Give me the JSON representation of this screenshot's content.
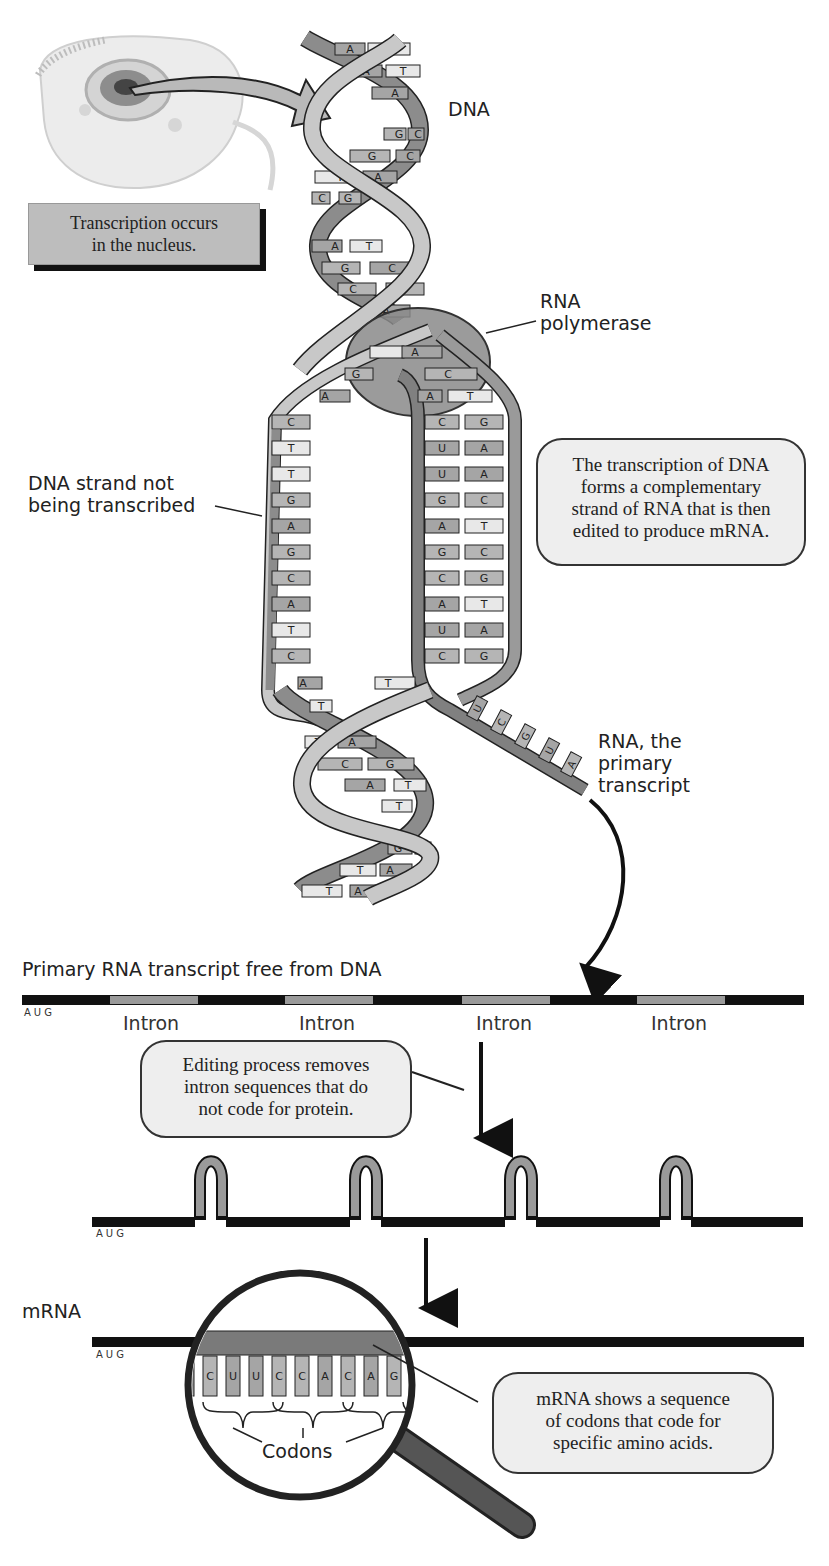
{
  "figure": {
    "labels": {
      "dna": "DNA",
      "rna_polymerase_line1": "RNA",
      "rna_polymerase_line2": "polymerase",
      "nontranscribed_line1": "DNA strand not",
      "nontranscribed_line2": "being transcribed",
      "primary_transcript_line1": "RNA, the",
      "primary_transcript_line2": "primary",
      "primary_transcript_line3": "transcript",
      "primary_free": "Primary RNA transcript free from DNA",
      "mrna": "mRNA",
      "codons": "Codons",
      "aug": "AUG"
    },
    "nucleus_box": {
      "line1": "Transcription occurs",
      "line2": "in the nucleus."
    },
    "callouts": {
      "transcription": [
        "The transcription of DNA",
        "forms a complementary",
        "strand of RNA that is then",
        "edited to produce mRNA."
      ],
      "editing": [
        "Editing process removes",
        "intron sequences that do",
        "not code for protein."
      ],
      "codons": [
        "mRNA shows a sequence",
        "of codons that code for",
        "specific amino acids."
      ]
    },
    "introns": [
      "Intron",
      "Intron",
      "Intron",
      "Intron"
    ],
    "helix_top_pairs": [
      [
        "A",
        "T"
      ],
      [
        "A",
        "T"
      ],
      [
        "A",
        ""
      ],
      [
        "G",
        "C"
      ],
      [
        "G",
        "C"
      ],
      [
        "T",
        "A"
      ],
      [
        "C",
        "G"
      ],
      [
        "A",
        "T"
      ],
      [
        "G",
        "C"
      ],
      [
        "C",
        "G"
      ],
      [
        "A",
        ""
      ]
    ],
    "bubble_pairs_top": [
      [
        "",
        "A"
      ],
      [
        "G",
        "C"
      ],
      [
        "A",
        "A"
      ],
      [
        "C",
        "T"
      ]
    ],
    "left_strand_bases": [
      "C",
      "T",
      "T",
      "G",
      "A",
      "G",
      "C",
      "A",
      "T",
      "C",
      "A"
    ],
    "template_strand_bases": [
      "G",
      "A",
      "A",
      "C",
      "T",
      "C",
      "G",
      "T",
      "A",
      "G"
    ],
    "rna_bases_in_bubble": [
      "C",
      "U",
      "U",
      "G",
      "A",
      "G",
      "C",
      "A",
      "U",
      "C"
    ],
    "rna_tail_bases": [
      "U",
      "C",
      "G",
      "U",
      "A"
    ],
    "helix_bottom_pairs": [
      [
        "T",
        ""
      ],
      [
        "T",
        "A"
      ],
      [
        "C",
        "G"
      ],
      [
        "A",
        "T"
      ],
      [
        "T",
        ""
      ],
      [
        "G",
        "C"
      ],
      [
        "T",
        "A"
      ],
      [
        "T",
        "A"
      ]
    ],
    "codon_bases": [
      "C",
      "U",
      "U",
      "C",
      "C",
      "A",
      "C",
      "A",
      "G"
    ],
    "colors": {
      "strand_dark": "#8c8c8c",
      "strand_light": "#c8c8c8",
      "base_dark": "#8f8f8f",
      "base_mid": "#b5b5b5",
      "base_light": "#e6e6e6",
      "polymerase": "#8a8a8a",
      "exon": "#111111",
      "intron": "#9a9a9a",
      "callout_bg": "#eeeeee",
      "nucleus_box_bg": "#bdbdbd"
    }
  }
}
